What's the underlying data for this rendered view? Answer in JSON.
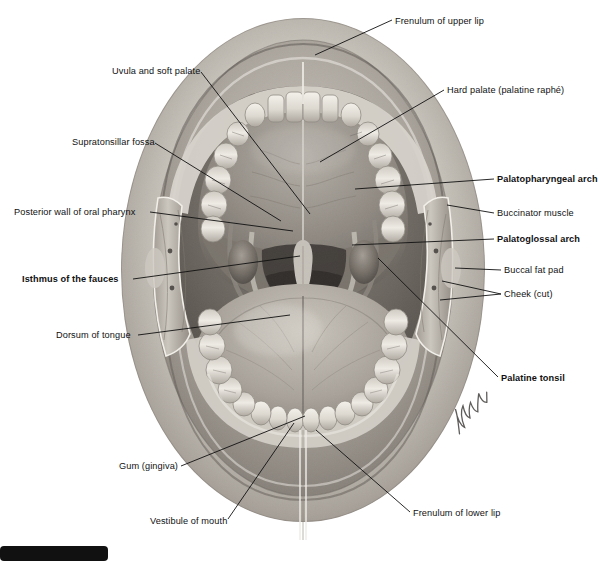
{
  "figure": {
    "artist_signature": "Netter",
    "palette": {
      "background": "#ffffff",
      "line": "#111111",
      "tissue_light": "#d9d6d0",
      "tissue_mid": "#a9a39a",
      "tissue_dark": "#6d6760",
      "cavity_dark": "#4a4views",
      "tooth": "#ece9e2"
    }
  },
  "labels": [
    {
      "id": "frenulum-upper-lip",
      "text": "Frenulum of upper lip",
      "side": "right",
      "bold": false,
      "x": 395,
      "y": 16,
      "leader": [
        [
          392,
          20
        ],
        [
          315,
          55
        ]
      ]
    },
    {
      "id": "uvula-soft-palate",
      "text": "Uvula and soft palate",
      "side": "left",
      "bold": false,
      "x": 112,
      "y": 66,
      "leader": [
        [
          201,
          72
        ],
        [
          310,
          214
        ]
      ]
    },
    {
      "id": "hard-palate",
      "text": "Hard palate (palatine raphé)",
      "side": "right",
      "bold": false,
      "x": 447,
      "y": 85,
      "leader": [
        [
          444,
          90
        ],
        [
          320,
          162
        ]
      ]
    },
    {
      "id": "supratonsillar-fossa",
      "text": "Supratonsillar fossa",
      "side": "left",
      "bold": false,
      "x": 72,
      "y": 137,
      "leader": [
        [
          155,
          143
        ],
        [
          281,
          221
        ]
      ]
    },
    {
      "id": "palatopharyngeal-arch",
      "text": "Palatopharyngeal arch",
      "side": "right",
      "bold": true,
      "x": 497,
      "y": 174,
      "leader": [
        [
          494,
          179
        ],
        [
          355,
          189
        ]
      ]
    },
    {
      "id": "posterior-wall-pharynx",
      "text": "Posterior wall of oral pharynx",
      "side": "left",
      "bold": false,
      "x": 14,
      "y": 207,
      "leader": [
        [
          150,
          212
        ],
        [
          293,
          231
        ]
      ]
    },
    {
      "id": "buccinator-muscle",
      "text": "Buccinator muscle",
      "side": "right",
      "bold": false,
      "x": 497,
      "y": 208,
      "leader": [
        [
          494,
          213
        ],
        [
          447,
          205
        ]
      ]
    },
    {
      "id": "palatoglossal-arch",
      "text": "Palatoglossal arch",
      "side": "right",
      "bold": true,
      "x": 497,
      "y": 234,
      "leader": [
        [
          494,
          239
        ],
        [
          352,
          245
        ]
      ]
    },
    {
      "id": "buccal-fat-pad",
      "text": "Buccal fat pad",
      "side": "right",
      "bold": false,
      "x": 504,
      "y": 265,
      "leader": [
        [
          501,
          270
        ],
        [
          455,
          268
        ]
      ]
    },
    {
      "id": "isthmus-of-fauces",
      "text": "Isthmus of the fauces",
      "side": "left",
      "bold": true,
      "x": 22,
      "y": 274,
      "leader": [
        [
          133,
          279
        ],
        [
          300,
          256
        ]
      ]
    },
    {
      "id": "cheek-cut",
      "text": "Cheek (cut)",
      "side": "right",
      "bold": false,
      "x": 504,
      "y": 289,
      "leader": [
        [
          501,
          294
        ],
        [
          442,
          281
        ]
      ]
    },
    {
      "id": "cheek-cut-2",
      "text": "",
      "side": "right",
      "bold": false,
      "x": 504,
      "y": 289,
      "leader": [
        [
          501,
          294
        ],
        [
          440,
          300
        ]
      ]
    },
    {
      "id": "dorsum-of-tongue",
      "text": "Dorsum of tongue",
      "side": "left",
      "bold": false,
      "x": 56,
      "y": 330,
      "leader": [
        [
          138,
          335
        ],
        [
          290,
          315
        ]
      ]
    },
    {
      "id": "palatine-tonsil",
      "text": "Palatine tonsil",
      "side": "right",
      "bold": true,
      "x": 501,
      "y": 373,
      "leader": [
        [
          498,
          377
        ],
        [
          378,
          258
        ]
      ]
    },
    {
      "id": "gum-gingiva",
      "text": "Gum (gingiva)",
      "side": "left",
      "bold": false,
      "x": 119,
      "y": 461,
      "leader": [
        [
          181,
          466
        ],
        [
          305,
          416
        ]
      ]
    },
    {
      "id": "vestibule-of-mouth",
      "text": "Vestibule of mouth",
      "side": "left",
      "bold": false,
      "x": 150,
      "y": 516,
      "leader": [
        [
          228,
          519
        ],
        [
          294,
          423
        ]
      ]
    },
    {
      "id": "frenulum-lower-lip",
      "text": "Frenulum of lower lip",
      "side": "right",
      "bold": false,
      "x": 413,
      "y": 508,
      "leader": [
        [
          410,
          512
        ],
        [
          316,
          430
        ]
      ]
    }
  ],
  "caption": {
    "badge": "",
    "text": ""
  },
  "chart_data": {
    "type": "table",
    "categories": [
      "Frenulum of upper lip",
      "Uvula and soft palate",
      "Hard palate (palatine raphé)",
      "Supratonsillar fossa",
      "Palatopharyngeal arch",
      "Posterior wall of oral pharynx",
      "Buccinator muscle",
      "Palatoglossal arch",
      "Buccal fat pad",
      "Isthmus of the fauces",
      "Cheek (cut)",
      "Dorsum of tongue",
      "Palatine tonsil",
      "Gum (gingiva)",
      "Vestibule of mouth",
      "Frenulum of lower lip"
    ],
    "values": [
      1,
      1,
      1,
      1,
      1,
      1,
      1,
      1,
      1,
      1,
      1,
      1,
      1,
      1,
      1,
      1
    ]
  }
}
